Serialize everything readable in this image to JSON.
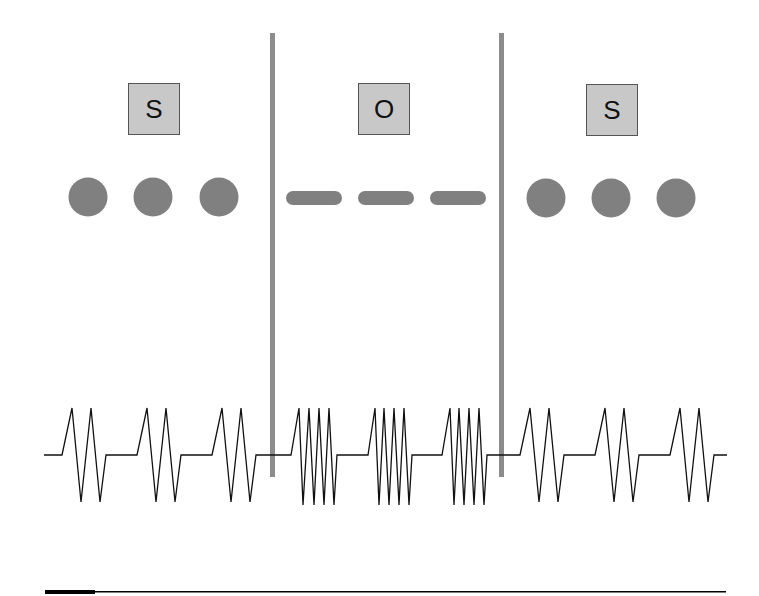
{
  "diagram": {
    "regions": [
      {
        "label": "S",
        "symbol": "circles",
        "count": 3,
        "wave": "double-spike"
      },
      {
        "label": "O",
        "symbol": "dashes",
        "count": 3,
        "wave": "quad-spike"
      },
      {
        "label": "S",
        "symbol": "circles",
        "count": 3,
        "wave": "double-spike"
      }
    ],
    "colors": {
      "box_fill": "#c8c8c8",
      "box_border": "#555555",
      "symbol_fill": "#808080",
      "divider": "#8c8c8c",
      "wave": "#111111",
      "bottom_rule": "#000000"
    }
  }
}
